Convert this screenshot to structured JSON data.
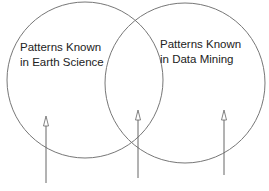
{
  "diagram": {
    "type": "venn",
    "sets": [
      {
        "id": "earth-science",
        "label_line1": "Patterns Known",
        "label_line2": "in Earth Science"
      },
      {
        "id": "data-mining",
        "label_line1": "Patterns Known",
        "label_line2": "in Data Mining"
      }
    ],
    "arrows": [
      {
        "points_to": "earth-science-only"
      },
      {
        "points_to": "intersection"
      },
      {
        "points_to": "data-mining-only"
      }
    ],
    "bottom_labels": {
      "left": "...",
      "right": "..."
    },
    "colors": {
      "stroke": "#777777",
      "text": "#222222"
    }
  }
}
